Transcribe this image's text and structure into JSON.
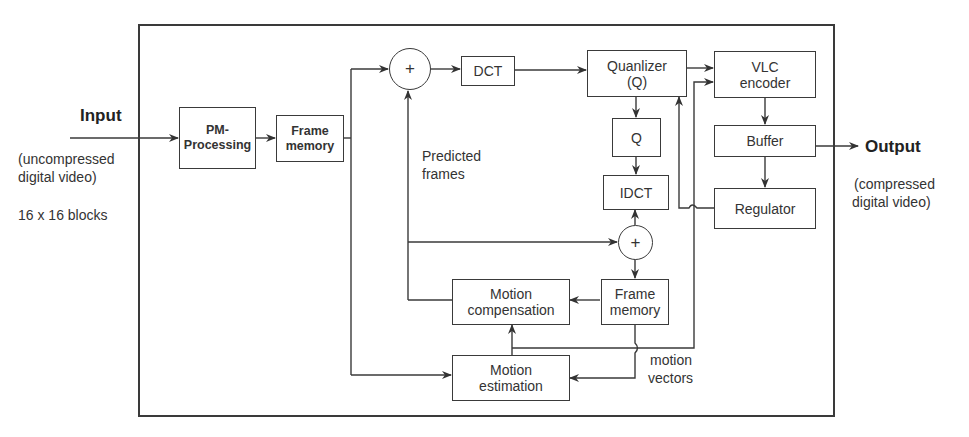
{
  "input": {
    "title": "Input",
    "desc_line1": "(uncompressed",
    "desc_line2": "digital video)",
    "block_size": "16 x 16 blocks"
  },
  "output": {
    "title": "Output",
    "desc_line1": "(compressed",
    "desc_line2": "digital video)"
  },
  "blocks": {
    "pm_processing": {
      "line1": "PM-",
      "line2": "Processing"
    },
    "frame_memory_in": {
      "line1": "Frame",
      "line2": "memory"
    },
    "sum_top": "+",
    "dct": "DCT",
    "quantizer": {
      "line1": "Quanlizer",
      "line2": "(Q)"
    },
    "q": "Q",
    "idct": "IDCT",
    "sum_bottom": "+",
    "frame_memory_loop": {
      "line1": "Frame",
      "line2": "memory"
    },
    "motion_compensation": {
      "line1": "Motion",
      "line2": "compensation"
    },
    "motion_estimation": {
      "line1": "Motion",
      "line2": "estimation"
    },
    "vlc_encoder": {
      "line1": "VLC",
      "line2": "encoder"
    },
    "buffer": "Buffer",
    "regulator": "Regulator"
  },
  "labels": {
    "predicted_frames_line1": "Predicted",
    "predicted_frames_line2": "frames",
    "motion_vectors_line1": "motion",
    "motion_vectors_line2": "vectors"
  },
  "colors": {
    "line": "#3a3a3a",
    "text": "#333333",
    "background": "#ffffff"
  }
}
